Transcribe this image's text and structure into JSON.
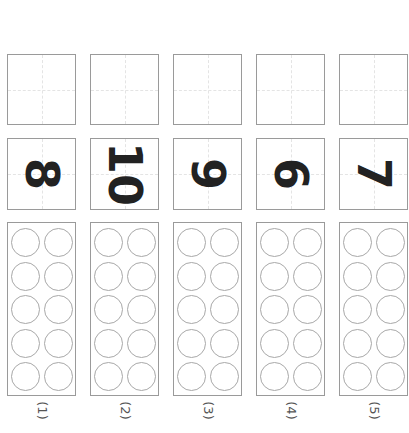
{
  "worksheet": {
    "columns": [
      {
        "label": "(1)",
        "number": "8",
        "circles": 10
      },
      {
        "label": "(2)",
        "number": "10",
        "circles": 10
      },
      {
        "label": "(3)",
        "number": "9",
        "circles": 10
      },
      {
        "label": "(4)",
        "number": "6",
        "circles": 10
      },
      {
        "label": "(5)",
        "number": "7",
        "circles": 10
      }
    ]
  },
  "colors": {
    "border": "#9a9a9a",
    "digit": "#222222",
    "circle": "#a8a8a8"
  }
}
